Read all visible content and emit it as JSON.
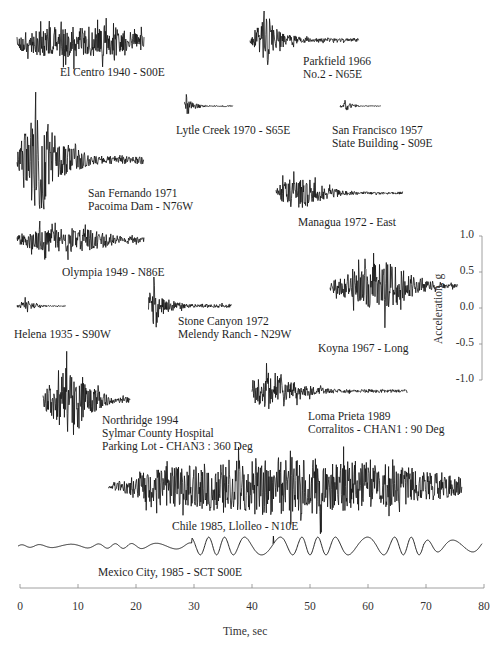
{
  "chart_data": {
    "type": "line",
    "title": "",
    "xlabel": "Time, sec",
    "ylabel": "Acceleration, g",
    "xlim": [
      0,
      80
    ],
    "xticks": [
      0,
      10,
      20,
      30,
      40,
      50,
      60,
      70,
      80
    ],
    "yscale": {
      "ylim": [
        -1.0,
        1.0
      ],
      "yticks": [
        "1.0",
        "0.5",
        "0.0",
        "-0.5",
        "-1.0"
      ]
    },
    "grid": false,
    "legend": "none",
    "series": [
      {
        "name": "El Centro 1940 - S00E",
        "label_lines": [
          "El Centro 1940 - S00E"
        ],
        "t_start": 0,
        "t_end": 30,
        "peak_g": 0.35,
        "strong_start": 1,
        "strong_end": 28,
        "style": "broadband"
      },
      {
        "name": "Parkfield 1966 No.2 - N65E",
        "label_lines": [
          "Parkfield 1966",
          "No.2 - N65E"
        ],
        "t_start": 0,
        "t_end": 26,
        "peak_g": 0.5,
        "strong_start": 2,
        "strong_end": 6,
        "style": "pulse"
      },
      {
        "name": "Lytle Creek 1970 - S65E",
        "label_lines": [
          "Lytle Creek 1970 - S65E"
        ],
        "t_start": 0,
        "t_end": 14,
        "peak_g": 0.2,
        "strong_start": 0,
        "strong_end": 2,
        "style": "short"
      },
      {
        "name": "San Francisco 1957 State Building - S09E",
        "label_lines": [
          "San Francisco 1957",
          "State Building - S09E"
        ],
        "t_start": 0,
        "t_end": 10,
        "peak_g": 0.1,
        "strong_start": 0.5,
        "strong_end": 2.5,
        "style": "short"
      },
      {
        "name": "San Fernando 1971 Pacoima Dam - N76W",
        "label_lines": [
          "San Fernando 1971",
          "Pacoima Dam - N76W"
        ],
        "t_start": 0,
        "t_end": 30,
        "peak_g": 1.17,
        "strong_start": 2,
        "strong_end": 9,
        "style": "strong"
      },
      {
        "name": "Managua 1972 - East",
        "label_lines": [
          "Managua 1972 - East"
        ],
        "t_start": 0,
        "t_end": 30,
        "peak_g": 0.37,
        "strong_start": 1,
        "strong_end": 10,
        "style": "decay"
      },
      {
        "name": "Olympia 1949 - N86E",
        "label_lines": [
          "Olympia 1949 - N86E"
        ],
        "t_start": 0,
        "t_end": 30,
        "peak_g": 0.28,
        "strong_start": 2,
        "strong_end": 20,
        "style": "broadband"
      },
      {
        "name": "Koyna 1967 - Long",
        "label_lines": [
          "Koyna 1967 - Long"
        ],
        "t_start": 0,
        "t_end": 10,
        "peak_g": 0.63,
        "strong_start": 2,
        "strong_end": 6,
        "style": "burst"
      },
      {
        "name": "Helena 1935 - S90W",
        "label_lines": [
          "Helena 1935 - S90W"
        ],
        "t_start": 0,
        "t_end": 14,
        "peak_g": 0.15,
        "strong_start": 1.5,
        "strong_end": 4,
        "style": "short"
      },
      {
        "name": "Stone Canyon 1972 Melendy Ranch - N29W",
        "label_lines": [
          "Stone Canyon 1972",
          "Melendy Ranch - N29W"
        ],
        "t_start": 0,
        "t_end": 20,
        "peak_g": 0.5,
        "strong_start": 0.5,
        "strong_end": 3,
        "style": "pulse"
      },
      {
        "name": "Northridge 1994 Sylmar County Hospital Parking Lot - CHAN3 : 360 Deg",
        "label_lines": [
          "Northridge 1994",
          "Sylmar County Hospital",
          "Parking Lot - CHAN3 : 360 Deg"
        ],
        "t_start": 0,
        "t_end": 20,
        "peak_g": 0.84,
        "strong_start": 3,
        "strong_end": 10,
        "style": "strong"
      },
      {
        "name": "Loma Prieta 1989 Corralitos - CHAN1 : 90 Deg",
        "label_lines": [
          "Loma Prieta 1989",
          "Corralitos - CHAN1 : 90 Deg"
        ],
        "t_start": 0,
        "t_end": 40,
        "peak_g": 0.48,
        "strong_start": 1,
        "strong_end": 9,
        "style": "decay"
      },
      {
        "name": "Chile 1985, Llolleo - N10E",
        "label_lines": [
          "Chile 1985, Llolleo - N10E"
        ],
        "t_start": 15,
        "t_end": 76,
        "peak_g": 0.67,
        "strong_start": 20,
        "strong_end": 70,
        "style": "long"
      },
      {
        "name": "Mexico City, 1985 - SCT S00E",
        "label_lines": [
          "Mexico City, 1985 - SCT S00E"
        ],
        "t_start": 0,
        "t_end": 80,
        "peak_g": 0.17,
        "strong_start": 30,
        "strong_end": 70,
        "style": "longperiod"
      }
    ]
  }
}
